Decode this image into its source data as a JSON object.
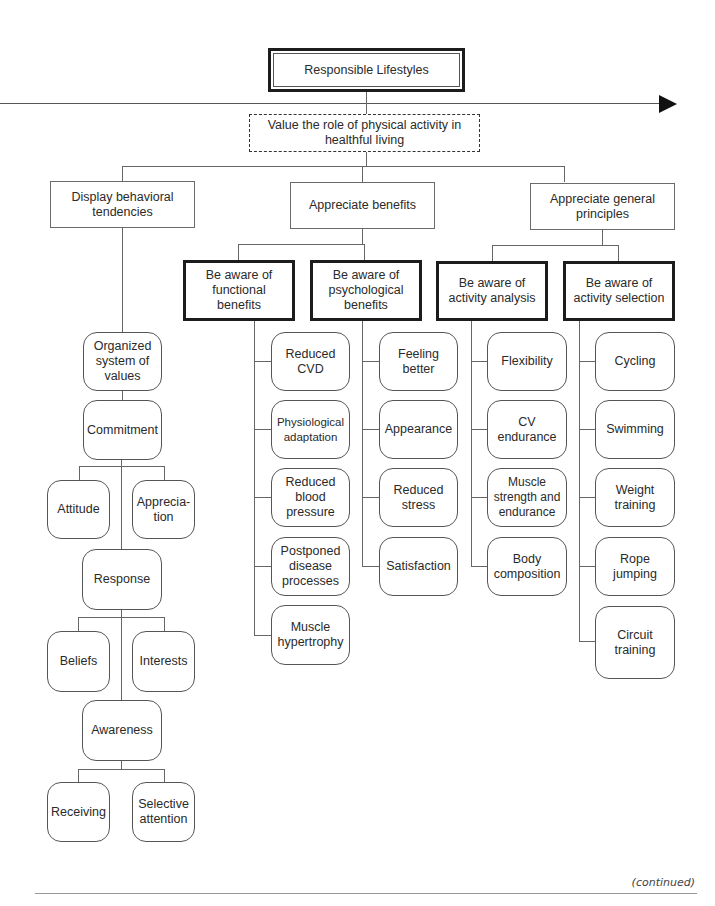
{
  "diagram": {
    "root": "Responsible Lifestyles",
    "goal": "Value the role of physical activity in healthful living",
    "level2": [
      {
        "label": "Display behavioral\ntendencies"
      },
      {
        "label": "Appreciate benefits"
      },
      {
        "label": "Appreciate general\nprinciples"
      }
    ],
    "level3": [
      {
        "label": "Be aware of\nfunctional\nbenefits",
        "items": [
          "Reduced\nCVD",
          "Physiological\nadaptation",
          "Reduced\nblood\npressure",
          "Postponed\ndisease\nprocesses",
          "Muscle\nhypertrophy"
        ]
      },
      {
        "label": "Be aware of\npsychological\nbenefits",
        "items": [
          "Feeling\nbetter",
          "Appearance",
          "Reduced\nstress",
          "Satisfaction"
        ]
      },
      {
        "label": "Be aware of\nactivity analysis",
        "items": [
          "Flexibility",
          "CV\nendurance",
          "Muscle\nstrength and\nendurance",
          "Body\ncomposition"
        ]
      },
      {
        "label": "Be aware of\nactivity selection",
        "items": [
          "Cycling",
          "Swimming",
          "Weight\ntraining",
          "Rope\njumping",
          "Circuit\ntraining"
        ]
      }
    ],
    "hierarchy": {
      "organized": "Organized\nsystem of\nvalues",
      "commitment": "Commitment",
      "attitude": "Attitude",
      "appreciation": "Apprecia-\ntion",
      "response": "Response",
      "beliefs": "Beliefs",
      "interests": "Interests",
      "awareness": "Awareness",
      "receiving": "Receiving",
      "selective": "Selective\nattention"
    }
  },
  "footer": {
    "continued": "(continued)"
  }
}
